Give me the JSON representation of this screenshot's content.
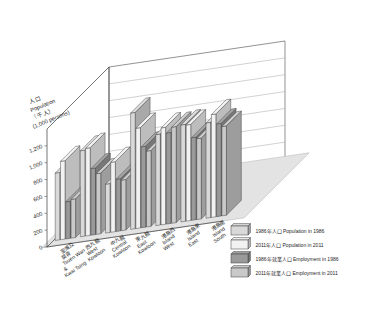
{
  "chart_data": {
    "type": "bar",
    "title": "",
    "subtitle": "",
    "xlabel": "",
    "ylabel_lines": [
      "人口",
      "Population",
      "（千人）",
      "(1,000 persons)"
    ],
    "ylim": [
      0,
      1400
    ],
    "yticks": [
      0,
      200,
      400,
      600,
      800,
      1000,
      1200
    ],
    "ytick_labels": [
      "0",
      "200",
      "400",
      "600",
      "800",
      "1,000",
      "1,200"
    ],
    "grid": true,
    "legend_position": "bottom-right",
    "projection": "3d-perspective",
    "categories": [
      "荃灣及葵青 Tsuen Wan & Kwai Tsing",
      "西九龍 West Kowloon",
      "中九龍 Central Kowloon",
      "東九龍 East Kowloon",
      "港島西 Island West",
      "港島東 Island East",
      "港島南 Island South"
    ],
    "categories_display": [
      {
        "zh": "荃灣及",
        "zh2": "葵青",
        "en1": "Tsuen Wan",
        "en2": "&",
        "en3": "Kwai Tsing"
      },
      {
        "zh": "西九龍",
        "zh2": "",
        "en1": "West",
        "en2": "Kowloon",
        "en3": ""
      },
      {
        "zh": "中九龍",
        "zh2": "",
        "en1": "Central",
        "en2": "Kowloon",
        "en3": ""
      },
      {
        "zh": "東九龍",
        "zh2": "",
        "en1": "East",
        "en2": "Kowloon",
        "en3": ""
      },
      {
        "zh": "港島西",
        "zh2": "",
        "en1": "Island",
        "en2": "West",
        "en3": ""
      },
      {
        "zh": "港島東",
        "zh2": "",
        "en1": "Island",
        "en2": "East",
        "en3": ""
      },
      {
        "zh": "港島南",
        "zh2": "",
        "en1": "Island",
        "en2": "South",
        "en3": ""
      }
    ],
    "series": [
      {
        "name": "1986年人口 Population in 1986",
        "color": "#d9d9d9",
        "values": [
          800,
          1020,
          580,
          1380,
          1080,
          1150,
          1130
        ]
      },
      {
        "name": "2011年人口 Population in 2011",
        "color": "#f2f2f2",
        "values": [
          930,
          1040,
          830,
          1190,
          1150,
          1140,
          1220
        ]
      },
      {
        "name": "1986年就業人口 Employment in 1986",
        "color": "#9a9a9a",
        "values": [
          440,
          790,
          620,
          960,
          1080,
          980,
          1100
        ]
      },
      {
        "name": "2011年就業人口 Employment in 2011",
        "color": "#c9c9c9",
        "values": [
          460,
          720,
          600,
          900,
          1140,
          960,
          1060
        ]
      }
    ]
  },
  "legend": {
    "items": [
      {
        "label": "1986年人口  Population in 1986",
        "color": "#d9d9d9"
      },
      {
        "label": "2011年人口  Population in 2011",
        "color": "#f2f2f2"
      },
      {
        "label": "1986年就業人口 Employment in 1986",
        "color": "#9a9a9a"
      },
      {
        "label": "2011年就業人口 Employment in 2011",
        "color": "#c9c9c9"
      }
    ]
  }
}
